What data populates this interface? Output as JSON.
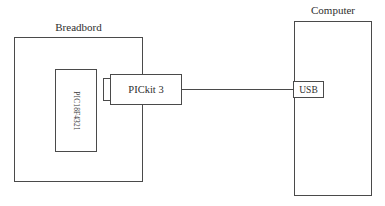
{
  "diagram": {
    "background_color": "#ffffff",
    "line_color": "#4a4a4a",
    "text_color": "#2e2e2e",
    "width": 385,
    "height": 206
  },
  "breadboard": {
    "caption": "Breadbord",
    "chip": {
      "label": "PIC18F4321",
      "orientation": "vertical"
    }
  },
  "programmer": {
    "label": "PICkit 3",
    "connector_label": ""
  },
  "cable": {
    "label": ""
  },
  "computer": {
    "caption": "Computer",
    "port": {
      "label": "USB"
    }
  }
}
